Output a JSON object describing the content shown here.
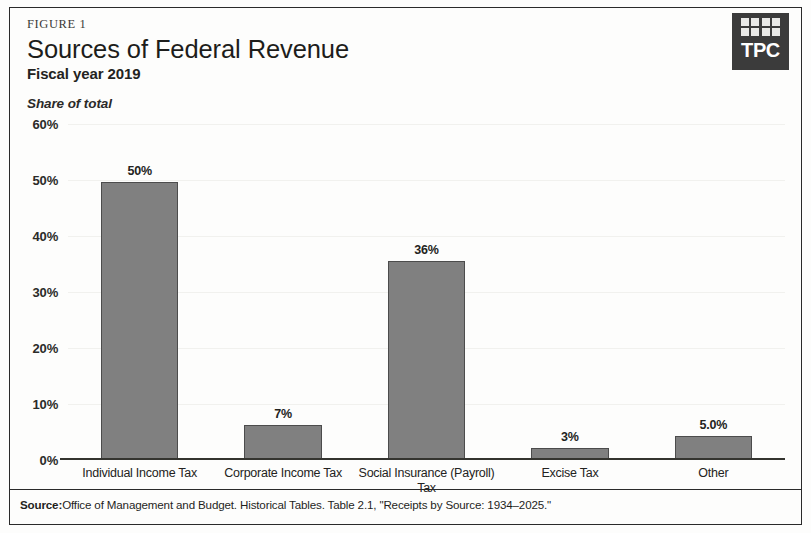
{
  "figure": {
    "kicker": "FIGURE 1",
    "title": "Sources of Federal Revenue",
    "subtitle": "Fiscal year 2019"
  },
  "logo": {
    "text": "TPC"
  },
  "source": {
    "prefix": "Source:",
    "text": "Office of Management and Budget. Historical Tables. Table 2.1, \"Receipts by Source: 1934–2025.\""
  },
  "colors": {
    "bar_fill": "#808080",
    "bar_stroke": "#4c4c4c",
    "axis": "#34342f",
    "text": "#232321"
  },
  "chart_data": {
    "type": "bar",
    "title": "Sources of Federal Revenue",
    "subtitle": "Fiscal year 2019",
    "xlabel": "",
    "ylabel": "Share of total",
    "ylim": [
      0,
      60
    ],
    "grid": false,
    "legend": "none",
    "y_ticks": [
      "0%",
      "10%",
      "20%",
      "30%",
      "40%",
      "50%",
      "60%"
    ],
    "y_tick_values": [
      0,
      10,
      20,
      30,
      40,
      50,
      60
    ],
    "categories": [
      "Individual Income Tax",
      "Corporate Income Tax",
      "Social Insurance (Payroll) Tax",
      "Excise Tax",
      "Other"
    ],
    "values": [
      49.7,
      6.3,
      35.5,
      2.1,
      4.2
    ],
    "data_labels": [
      "50%",
      "7%",
      "36%",
      "3%",
      "5.0%"
    ]
  }
}
